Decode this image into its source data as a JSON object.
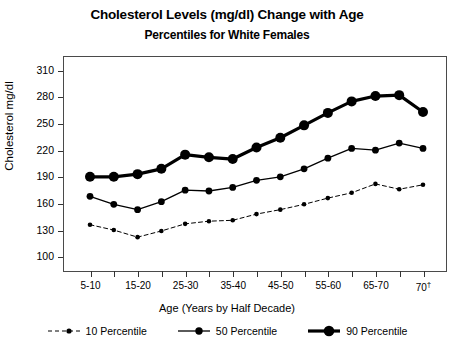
{
  "chart_data": {
    "type": "line",
    "title": "Cholesterol Levels (mg/dl) Change with Age",
    "subtitle": "Percentiles for White Females",
    "xlabel": "Age (Years by Half Decade)",
    "ylabel": "Cholesterol mg/dl",
    "ylim": [
      85,
      325
    ],
    "yticks": [
      100,
      130,
      160,
      190,
      220,
      250,
      280,
      310
    ],
    "grid": false,
    "legend_position": "bottom",
    "x": [
      1,
      2,
      3,
      4,
      5,
      6,
      7,
      8,
      9,
      10,
      11,
      12,
      13,
      14,
      15
    ],
    "categories": [
      "5-10",
      "10-15",
      "15-20",
      "20-25",
      "25-30",
      "30-35",
      "35-40",
      "40-45",
      "45-50",
      "50-55",
      "55-60",
      "60-65",
      "65-70",
      "70-75",
      "70+"
    ],
    "xtick_labels": [
      "5-10",
      "",
      "15-20",
      "",
      "25-30",
      "",
      "35-40",
      "",
      "45-50",
      "",
      "55-60",
      "",
      "65-70",
      "",
      "70"
    ],
    "xtick_last_dagger": "†",
    "series": [
      {
        "name": "90 Percentile",
        "label": "90 Percentile",
        "color": "#000000",
        "line_width": 3.2,
        "marker_size": 5.0,
        "dash": "none",
        "values": [
          190,
          190,
          193,
          199,
          215,
          212,
          210,
          223,
          234,
          248,
          262,
          275,
          281,
          282,
          263
        ]
      },
      {
        "name": "50 Percentile",
        "label": "50 Percentile",
        "color": "#000000",
        "line_width": 1.3,
        "marker_size": 3.4,
        "dash": "none",
        "values": [
          168,
          159,
          153,
          162,
          175,
          174,
          178,
          186,
          190,
          199,
          211,
          222,
          220,
          228,
          222
        ]
      },
      {
        "name": "10 Percentile",
        "label": "10 Percentile",
        "color": "#000000",
        "line_width": 1.0,
        "marker_size": 2.3,
        "dash": "4,3",
        "values": [
          136,
          130,
          122,
          129,
          137,
          140,
          141,
          148,
          153,
          159,
          166,
          172,
          182,
          176,
          181
        ]
      }
    ]
  }
}
